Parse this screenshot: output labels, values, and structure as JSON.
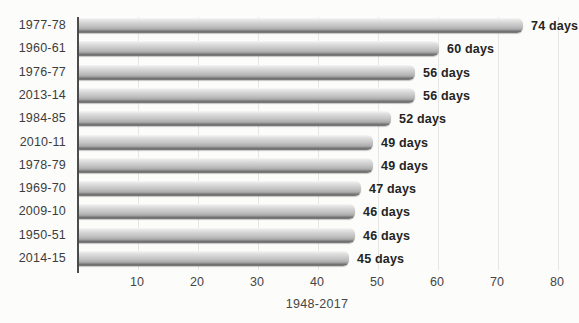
{
  "chart_data": {
    "type": "bar",
    "orientation": "horizontal",
    "title": "",
    "xlabel": "1948-2017",
    "ylabel": "",
    "unit": "days",
    "categories": [
      "1977-78",
      "1960-61",
      "1976-77",
      "2013-14",
      "1984-85",
      "2010-11",
      "1978-79",
      "1969-70",
      "2009-10",
      "1950-51",
      "2014-15"
    ],
    "values": [
      74,
      60,
      56,
      56,
      52,
      49,
      49,
      47,
      46,
      46,
      45
    ],
    "value_labels": [
      "74 days",
      "60 days",
      "56 days",
      "56 days",
      "52 days",
      "49 days",
      "49 days",
      "47 days",
      "46 days",
      "46 days",
      "45 days"
    ],
    "xticks": [
      10,
      20,
      30,
      40,
      50,
      60,
      70,
      80
    ],
    "xlim": [
      0,
      80
    ],
    "grid": "vertical, light gray, at each x tick",
    "legend": "none",
    "bar_style": "gray metallic vertical gradient with dark bottom band, rounded right end"
  },
  "colors": {
    "background": "#fcfcfa",
    "axis_line": "#4d4d4d",
    "gridline": "#e6e6e4",
    "bar_light": "#f7f7f7",
    "bar_mid": "#c1c1c1",
    "bar_dark_band": "#6d6d6d",
    "category_text": "#3d3d3d",
    "value_text": "#242424",
    "tick_text": "#454545"
  }
}
